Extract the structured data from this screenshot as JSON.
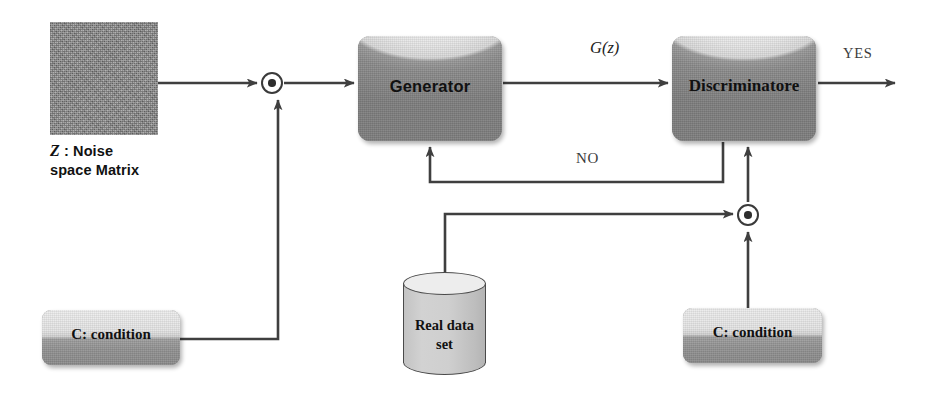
{
  "diagram": {
    "colors": {
      "wire": "#3f3f3f",
      "box_dark": "#8a8a8a",
      "box_light": "#ededed",
      "noise_fill": "#8b8b8b",
      "text": "#111111"
    },
    "noise": {
      "symbol": "Z",
      "caption_line1": " : Noise",
      "caption_line2": "space Matrix"
    },
    "blocks": {
      "generator": "Generator",
      "discriminator": "Discriminatore",
      "condition_left": "C: condition",
      "condition_right": "C: condition",
      "dataset_line1": "Real data",
      "dataset_line2": "set"
    },
    "edges": {
      "generator_output": "G(z)",
      "negative": "NO",
      "positive": "YES"
    },
    "nodes": {
      "combine_generator": "combine-operator",
      "combine_discriminator": "combine-operator"
    }
  }
}
